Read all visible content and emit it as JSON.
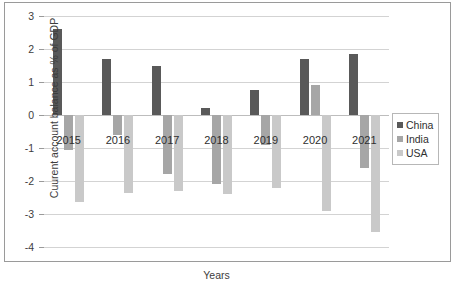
{
  "chart_data": {
    "type": "bar",
    "title": "",
    "xlabel": "Years",
    "ylabel": "Cuurent account balance as % of GDP",
    "categories": [
      "2015",
      "2016",
      "2017",
      "2018",
      "2019",
      "2020",
      "2021"
    ],
    "series": [
      {
        "name": "China",
        "color": "#595959",
        "values": [
          2.6,
          1.7,
          1.5,
          0.2,
          0.75,
          1.7,
          1.85
        ]
      },
      {
        "name": "India",
        "color": "#a6a6a6",
        "values": [
          -1.05,
          -0.6,
          -1.8,
          -2.1,
          -0.9,
          0.9,
          -1.6
        ]
      },
      {
        "name": "USA",
        "color": "#c9c9c9",
        "values": [
          -2.65,
          -2.35,
          -2.3,
          -2.4,
          -2.2,
          -2.9,
          -3.55
        ]
      }
    ],
    "ylim": [
      -4,
      3
    ],
    "yticks": [
      "3",
      "2",
      "1",
      "0",
      "-1",
      "-2",
      "-3",
      "-4"
    ],
    "ytick_values": [
      3,
      2,
      1,
      0,
      -1,
      -2,
      -3,
      -4
    ],
    "grid": true,
    "legend_position": "right"
  },
  "legend": {
    "entries": [
      {
        "label": "China",
        "color": "#595959"
      },
      {
        "label": "India",
        "color": "#a6a6a6"
      },
      {
        "label": "USA",
        "color": "#c9c9c9"
      }
    ]
  },
  "caption": ""
}
